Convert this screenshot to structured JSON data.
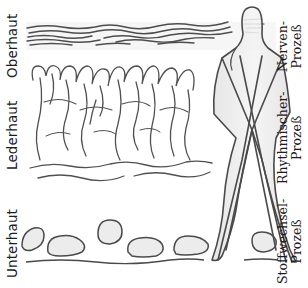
{
  "figure": {
    "type": "hand-drawn pencil diagram"
  },
  "skin_layers": [
    {
      "id": "oberhaut",
      "label": "Oberhaut"
    },
    {
      "id": "lederhaut",
      "label": "Lederhaut"
    },
    {
      "id": "unterhaut",
      "label": "Unterhaut"
    }
  ],
  "processes": [
    {
      "id": "nerven",
      "line1": "Nerven-",
      "line2": "Prozeß"
    },
    {
      "id": "rhythmisch",
      "line1": "Rhythmischer-",
      "line2": "Prozeß"
    },
    {
      "id": "stoffwechsel",
      "line1": "Stoffwechsel-",
      "line2": "Prozeß"
    }
  ],
  "colors": {
    "stroke": "#4a4a4a",
    "shade": "#d9d9d9",
    "text": "#1c1c1c",
    "background": "#ffffff"
  }
}
